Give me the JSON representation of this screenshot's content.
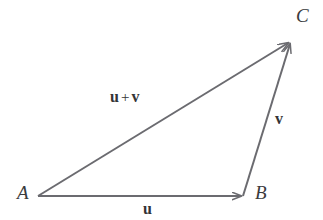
{
  "figure": {
    "type": "vector-triangle-diagram",
    "width": 323,
    "height": 220,
    "background_color": "#ffffff",
    "stroke_color": "#6b6b70",
    "text_color": "#3b3b3d",
    "stroke_width": 2
  },
  "vertices": [
    {
      "id": "A",
      "label": "A",
      "x": 38,
      "y": 196
    },
    {
      "id": "B",
      "label": "B",
      "x": 243,
      "y": 196
    },
    {
      "id": "C",
      "label": "C",
      "x": 291,
      "y": 41
    }
  ],
  "vectors": [
    {
      "id": "u",
      "label": "u",
      "from": "A",
      "to": "B",
      "from_point": {
        "x": 38,
        "y": 196
      },
      "to_point": {
        "x": 243,
        "y": 196
      },
      "arrowhead": true
    },
    {
      "id": "v",
      "label": "v",
      "from": "B",
      "to": "C",
      "from_point": {
        "x": 243,
        "y": 196
      },
      "to_point": {
        "x": 291,
        "y": 41
      },
      "arrowhead": true
    },
    {
      "id": "u-plus-v",
      "label_left": "u",
      "label_operator": "+",
      "label_right": "v",
      "from": "A",
      "to": "C",
      "from_point": {
        "x": 38,
        "y": 196
      },
      "to_point": {
        "x": 291,
        "y": 41
      },
      "arrowhead": true
    }
  ]
}
